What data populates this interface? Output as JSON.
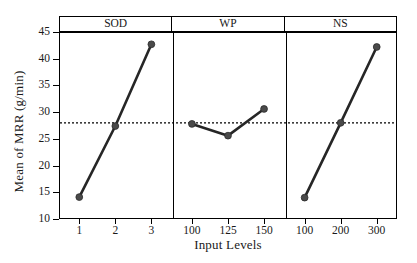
{
  "chart_data": {
    "type": "line",
    "title": "",
    "xlabel": "Input Levels",
    "ylabel": "Mean of MRR (g/min)",
    "ylim": [
      10,
      45
    ],
    "yticks": [
      10,
      15,
      20,
      25,
      30,
      35,
      40,
      45
    ],
    "grid": false,
    "legend": "none",
    "reference_line": {
      "value": 28.0,
      "style": "dotted",
      "label": "grand mean"
    },
    "panels": [
      {
        "name": "SOD",
        "categories": [
          "1",
          "2",
          "3"
        ],
        "values": [
          14.1,
          27.4,
          42.7
        ]
      },
      {
        "name": "WP",
        "categories": [
          "100",
          "125",
          "150"
        ],
        "values": [
          27.8,
          25.6,
          30.6
        ]
      },
      {
        "name": "NS",
        "categories": [
          "100",
          "200",
          "300"
        ],
        "values": [
          14.0,
          28.0,
          42.2
        ]
      }
    ],
    "marker": "filled-circle",
    "series_color": "#262626",
    "marker_color": "#4a4a4a"
  },
  "colors": {
    "axis": "#000000",
    "line": "#262626",
    "marker": "#4a4a4a",
    "background": "#ffffff"
  }
}
